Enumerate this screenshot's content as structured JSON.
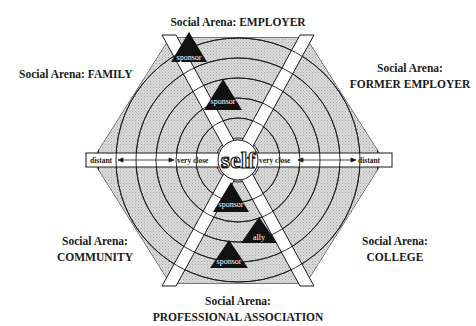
{
  "diagram": {
    "center_label": "self",
    "axis": {
      "left_outer": "distant",
      "left_inner": "very close",
      "right_inner": "very close",
      "right_outer": "distant"
    },
    "arenas": [
      {
        "id": "employer",
        "line1": "Social Arena: EMPLOYER",
        "line2": ""
      },
      {
        "id": "family",
        "line1": "Social Arena: FAMILY",
        "line2": ""
      },
      {
        "id": "former-employer",
        "line1": "Social Arena:",
        "line2": "FORMER EMPLOYER"
      },
      {
        "id": "community",
        "line1": "Social Arena:",
        "line2": "COMMUNITY"
      },
      {
        "id": "college",
        "line1": "Social Arena:",
        "line2": "COLLEGE"
      },
      {
        "id": "professional-association",
        "line1": "Social Arena:",
        "line2": "PROFESSIONAL ASSOCIATION"
      }
    ],
    "markers": [
      {
        "label": "sponsor",
        "arena": "employer",
        "ring": "outer"
      },
      {
        "label": "sponsor",
        "arena": "employer",
        "ring": "middle"
      },
      {
        "label": "sponsor",
        "arena": "professional-association",
        "ring": "inner"
      },
      {
        "label": "ally",
        "arena": "professional-association",
        "ring": "middle"
      },
      {
        "label": "sponsor",
        "arena": "professional-association",
        "ring": "outer"
      }
    ],
    "colors": {
      "sector_fill": "#d6d6d6",
      "line": "#1a1a1a",
      "marker_fill": "#111111",
      "marker_text": "#ffffff",
      "band": "#ffffff"
    }
  }
}
